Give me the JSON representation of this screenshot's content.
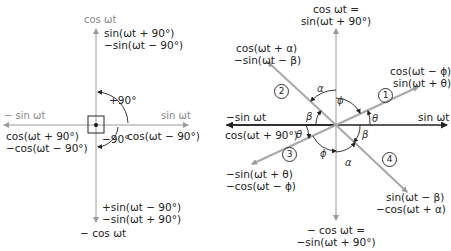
{
  "left_diagram": {
    "axes": {
      "up": "cos ωt",
      "down": "− cos ωt",
      "left": "− sin ωt",
      "right": "sin ωt"
    },
    "labels": {
      "up_line1": "sin(ωt + 90°)",
      "up_line2": "−sin(ωt − 90°)",
      "left_line1": "cos(ωt + 90°)",
      "left_line2": "−cos(ωt − 90°)",
      "right_line1": "cos(ωt − 90°)",
      "down_line1": "+sin(ωt − 90°)",
      "down_line2": "−sin(ωt + 90°)",
      "angle_pos": "+90°",
      "angle_neg": "−90°"
    }
  },
  "right_diagram": {
    "axes": {
      "up_line1": "cos ωt =",
      "up_line2": "sin(ωt + 90°)",
      "down_line1": "− cos ωt =",
      "down_line2": "−sin(ωt + 90°)",
      "left_line1": "−sin ωt",
      "left_line2": "cos(ωt + 90°)",
      "right": "sin ωt"
    },
    "phasors": [
      {
        "id": "1",
        "line1": "cos(ωt − ϕ)",
        "line2": "sin(ωt + θ)"
      },
      {
        "id": "2",
        "line1": "cos(ωt + α)",
        "line2": "−sin(ωt − β)"
      },
      {
        "id": "3",
        "line1": "−sin(ωt + θ)",
        "line2": "−cos(ωt − ϕ)"
      },
      {
        "id": "4",
        "line1": "sin(ωt − β)",
        "line2": "−cos(ωt + α)"
      }
    ],
    "angles": {
      "alpha": "α",
      "beta": "β",
      "phi": "ϕ",
      "theta": "θ"
    }
  },
  "colors": {
    "axis_gray": "#9a9a9a",
    "phasor_gray": "#a8a8a8",
    "dark_axis": "#222222"
  }
}
